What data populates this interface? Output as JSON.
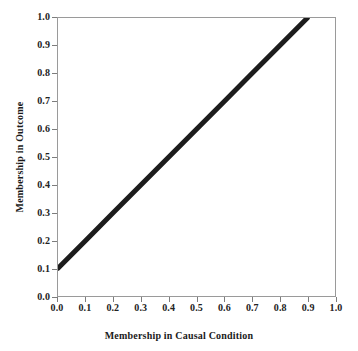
{
  "chart_data": {
    "type": "line",
    "title": "",
    "xlabel": "Membership in Causal Condition",
    "ylabel": "Membership in Outcome",
    "xlim": [
      0.0,
      1.0
    ],
    "ylim": [
      0.0,
      1.0
    ],
    "grid": false,
    "legend": null,
    "xticks": [
      "0.0",
      "0.1",
      "0.2",
      "0.3",
      "0.4",
      "0.5",
      "0.6",
      "0.7",
      "0.8",
      "0.9",
      "1.0"
    ],
    "yticks": [
      "0.0",
      "0.1",
      "0.2",
      "0.3",
      "0.4",
      "0.5",
      "0.6",
      "0.7",
      "0.8",
      "0.9",
      "1.0"
    ],
    "xtick_values": [
      0.0,
      0.1,
      0.2,
      0.3,
      0.4,
      0.5,
      0.6,
      0.7,
      0.8,
      0.9,
      1.0
    ],
    "ytick_values": [
      0.0,
      0.1,
      0.2,
      0.3,
      0.4,
      0.5,
      0.6,
      0.7,
      0.8,
      0.9,
      1.0
    ],
    "series": [
      {
        "name": "upper bound relation",
        "color": "#1c1c1c",
        "line_width": 5,
        "x": [
          0.0,
          0.1,
          0.2,
          0.3,
          0.4,
          0.5,
          0.6,
          0.7,
          0.8,
          0.9
        ],
        "y": [
          0.1,
          0.2,
          0.3,
          0.4,
          0.5,
          0.6,
          0.7,
          0.8,
          0.9,
          1.0
        ]
      }
    ]
  },
  "style": {
    "background_color": "#ffffff",
    "axis_color": "#9a9a9a",
    "tick_color": "#7d7d7d",
    "text_color": "#1a1a1a"
  }
}
